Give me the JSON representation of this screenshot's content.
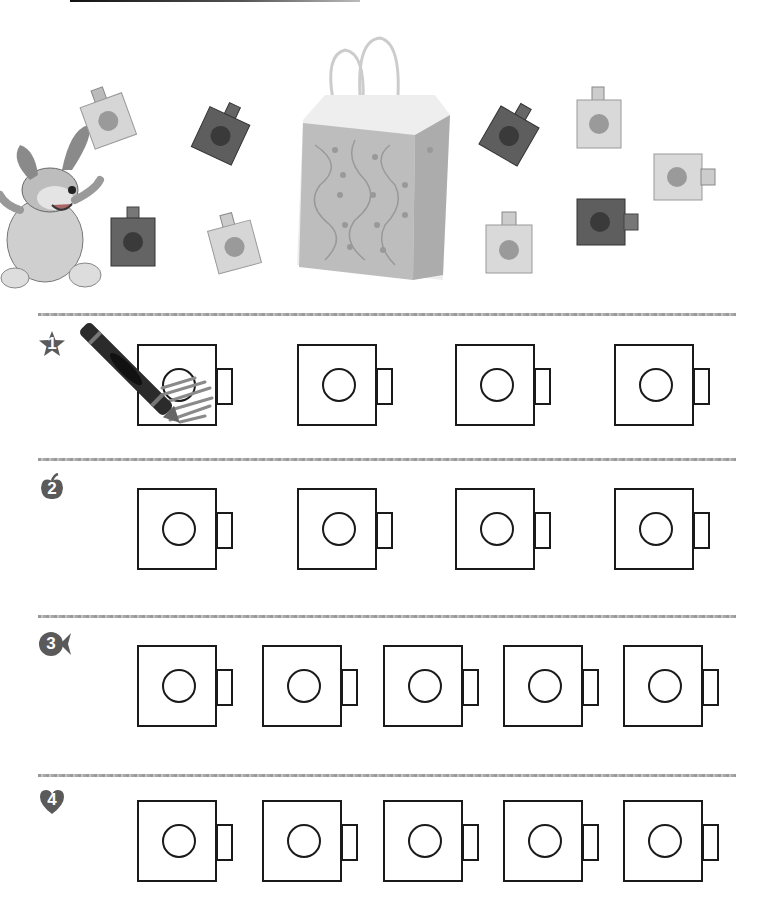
{
  "worksheet": {
    "header_bar": "",
    "illustration": {
      "character": "cartoon-dog",
      "bag": "patterned paper bag",
      "linking_cubes_left": [
        {
          "shade": "light",
          "x": 78,
          "y": 85,
          "rot": -20
        },
        {
          "shade": "dark",
          "x": 186,
          "y": 100,
          "rot": 25
        },
        {
          "shade": "dark",
          "x": 110,
          "y": 205,
          "rot": 0
        },
        {
          "shade": "light",
          "x": 203,
          "y": 215,
          "rot": -15
        }
      ],
      "linking_cubes_right": [
        {
          "shade": "dark",
          "x": 476,
          "y": 105,
          "rot": 30
        },
        {
          "shade": "light",
          "x": 575,
          "y": 90,
          "rot": -5
        },
        {
          "shade": "light",
          "x": 653,
          "y": 152,
          "rot": 0
        },
        {
          "shade": "dark",
          "x": 576,
          "y": 197,
          "rot": 0
        },
        {
          "shade": "light",
          "x": 485,
          "y": 212,
          "rot": 0
        }
      ]
    },
    "rows": [
      {
        "number": "1",
        "badge_shape": "star",
        "cube_x": [
          137,
          297,
          455,
          614
        ],
        "top": 344,
        "separator_y": 313,
        "example_colored": true
      },
      {
        "number": "2",
        "badge_shape": "apple",
        "cube_x": [
          137,
          297,
          455,
          614
        ],
        "top": 488,
        "separator_y": 458,
        "example_colored": false
      },
      {
        "number": "3",
        "badge_shape": "fish",
        "cube_x": [
          137,
          262,
          383,
          503,
          623
        ],
        "top": 645,
        "separator_y": 615,
        "example_colored": false
      },
      {
        "number": "4",
        "badge_shape": "heart",
        "cube_x": [
          137,
          262,
          383,
          503,
          623
        ],
        "top": 800,
        "separator_y": 774,
        "example_colored": false
      }
    ],
    "colors": {
      "badge": "#5a5a5a",
      "outline": "#1a1a1a",
      "crayon": "#2b2b2b",
      "scribble": "#8a8a8a"
    }
  }
}
